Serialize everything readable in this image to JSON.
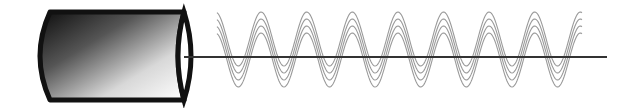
{
  "diagram": {
    "title": "Cylinder emitting polarized sine waves along an axis",
    "elements": {
      "cylinder": {
        "label": "",
        "fill_dark": "#111111",
        "fill_light": "#ffffff",
        "stroke": "#111111"
      },
      "axis": {
        "label": "",
        "color": "#333333"
      },
      "waves": {
        "count": 4,
        "color": "#9a9a9a",
        "periods": 8
      }
    }
  }
}
